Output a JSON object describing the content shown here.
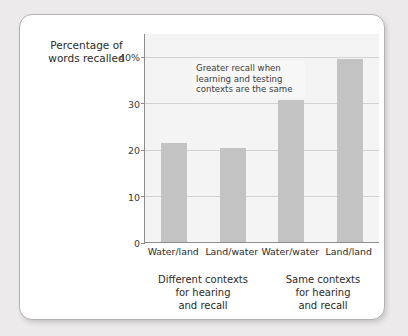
{
  "chart_data": {
    "type": "bar",
    "title": "",
    "ylabel": "Percentage of words recalled",
    "xlabel": "",
    "categories": [
      "Water/land",
      "Land/water",
      "Water/water",
      "Land/land"
    ],
    "values": [
      21.4,
      20.2,
      30.5,
      39.3
    ],
    "ylim": [
      0,
      45
    ],
    "yticks": [
      0,
      10,
      20,
      30,
      40
    ],
    "ytick_labels": [
      "0",
      "10",
      "20",
      "30",
      "40%"
    ],
    "grid": true,
    "legend": "none",
    "bar_color": "#c3c3c3",
    "plot_background": "#f4f4f4",
    "annotations": [
      {
        "name": "greater-recall-note",
        "line1": "Greater recall when",
        "line2": "learning and testing",
        "line3": "contexts are the same"
      }
    ],
    "groups": [
      {
        "line1": "Different contexts",
        "line2": "for hearing",
        "line3": "and recall"
      },
      {
        "line1": "Same contexts",
        "line2": "for hearing",
        "line3": "and recall"
      }
    ]
  },
  "axis_title": {
    "line1": "Percentage of",
    "line2": "words recalled"
  }
}
